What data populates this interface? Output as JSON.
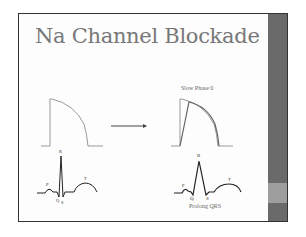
{
  "slide": {
    "title": "Na Channel Blockade",
    "right_diagram": {
      "caption_top": "Slow Phase 0",
      "caption_bottom": "Prolong QRS"
    },
    "left_ecg_labels": {
      "r": "R",
      "p": "P",
      "t": "T",
      "q": "Q",
      "s": "S"
    },
    "right_ecg_labels": {
      "r": "R",
      "p": "P",
      "t": "T",
      "q": "Q",
      "s": "S"
    },
    "colors": {
      "title": "#777777",
      "sidebar": "#6a6a6a",
      "sidebar_accent": "#9e9e9e",
      "action_potential_normal": "#999999",
      "action_potential_slow": "#666666",
      "ecg": "#222222"
    }
  }
}
